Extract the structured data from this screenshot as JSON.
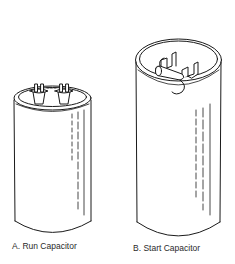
{
  "figure": {
    "items": [
      {
        "id": "A",
        "label": "A. Run Capacitor"
      },
      {
        "id": "B",
        "label": "B. Start Capacitor"
      }
    ],
    "colors": {
      "line": "#1a1a1a",
      "background": "#ffffff"
    }
  }
}
